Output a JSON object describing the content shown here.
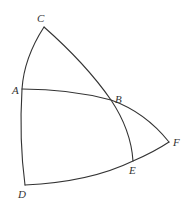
{
  "diagram": {
    "type": "spherical-geometry-figure",
    "stroke_color": "#333333",
    "background": "#ffffff",
    "points": {
      "C": {
        "label": "C",
        "x": 44,
        "y": 27,
        "lx": 37,
        "ly": 22
      },
      "A": {
        "label": "A",
        "x": 22,
        "y": 89,
        "lx": 12,
        "ly": 94
      },
      "B": {
        "label": "B",
        "x": 111,
        "y": 100,
        "lx": 115,
        "ly": 103
      },
      "F": {
        "label": "F",
        "x": 169,
        "y": 142,
        "lx": 173,
        "ly": 146
      },
      "E": {
        "label": "E",
        "x": 133,
        "y": 161,
        "lx": 129,
        "ly": 174
      },
      "D": {
        "label": "D",
        "x": 25,
        "y": 185,
        "lx": 18,
        "ly": 198
      }
    },
    "arcs": [
      {
        "name": "arc-C-A-D",
        "from": "C",
        "via": "A",
        "to": "D"
      },
      {
        "name": "arc-C-B-E",
        "from": "C",
        "via": "B",
        "to": "E"
      },
      {
        "name": "arc-A-B-F",
        "from": "A",
        "via": "B",
        "to": "F"
      },
      {
        "name": "arc-D-E-F",
        "from": "D",
        "via": "E",
        "to": "F"
      }
    ]
  }
}
